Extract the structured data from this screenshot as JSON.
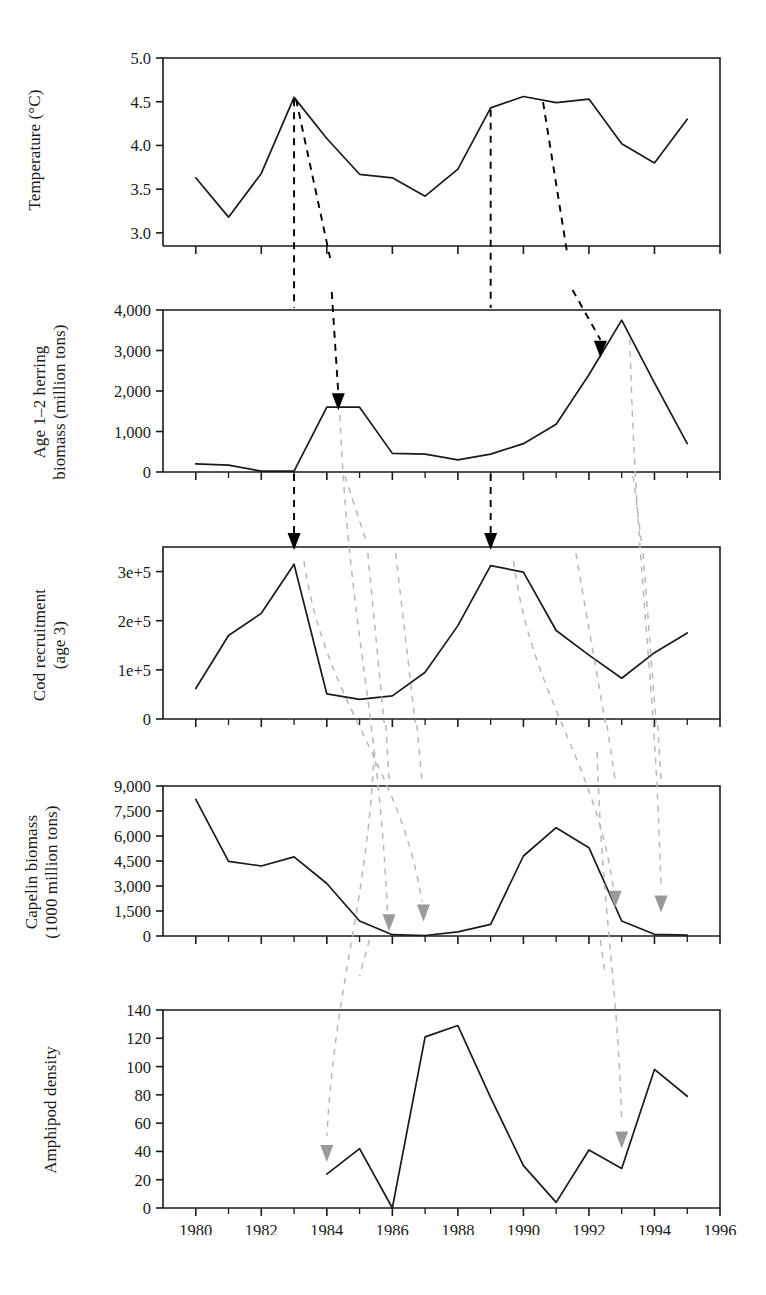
{
  "figure": {
    "width": 766,
    "height": 1295,
    "background": "#ffffff",
    "line_color": "#1a1a1a",
    "axis_color": "#1a1a1a",
    "black_arrow_color": "#000000",
    "gray_arrow_color": "#9a9a9a",
    "dashed_black_color": "#000000",
    "dashed_gray_color": "#b8b8b8"
  },
  "x_axis": {
    "label": "",
    "min": 1979,
    "max": 1996,
    "ticks": [
      1980,
      1982,
      1984,
      1986,
      1988,
      1990,
      1992,
      1994,
      1996
    ],
    "tick_labels": [
      "1980",
      "1982",
      "1984",
      "1986",
      "1988",
      "1990",
      "1992",
      "1994",
      "1996"
    ],
    "minor_step": 1
  },
  "chart_data": [
    {
      "type": "line",
      "panel": 1,
      "title": "",
      "ylabel": "Temperature (°C)",
      "xlabel": "",
      "ylim": [
        2.85,
        5.0
      ],
      "yticks": [
        3.0,
        3.5,
        4.0,
        4.5,
        5.0
      ],
      "ytick_labels": [
        "3.0",
        "3.5",
        "4.0",
        "4.5",
        "5.0"
      ],
      "x": [
        1980,
        1981,
        1982,
        1983,
        1984,
        1985,
        1986,
        1987,
        1988,
        1989,
        1990,
        1991,
        1992,
        1993,
        1994,
        1995
      ],
      "values": [
        3.63,
        3.18,
        3.68,
        4.55,
        4.08,
        3.67,
        3.63,
        3.42,
        3.73,
        4.43,
        4.56,
        4.49,
        4.53,
        4.02,
        3.8,
        4.3
      ],
      "grid": false,
      "legend": "none"
    },
    {
      "type": "line",
      "panel": 2,
      "title": "",
      "ylabel": "Age 1–2 herring biomass (million tons)",
      "ylabel_lines": [
        "Age 1–2 herring",
        "biomass (million tons)"
      ],
      "xlabel": "",
      "ylim": [
        0,
        4000
      ],
      "yticks": [
        0,
        1000,
        2000,
        3000,
        4000
      ],
      "ytick_labels": [
        "0",
        "1,000",
        "2,000",
        "3,000",
        "4,000"
      ],
      "x": [
        1980,
        1981,
        1982,
        1983,
        1984,
        1985,
        1986,
        1987,
        1988,
        1989,
        1990,
        1991,
        1992,
        1993,
        1994,
        1995
      ],
      "values": [
        200,
        170,
        20,
        20,
        1600,
        1600,
        460,
        440,
        300,
        440,
        700,
        1180,
        2400,
        3750,
        2200,
        700
      ],
      "grid": false,
      "legend": "none"
    },
    {
      "type": "line",
      "panel": 3,
      "title": "",
      "ylabel": "Cod recruitment (age 3)",
      "ylabel_lines": [
        "Cod recruitment",
        "(age 3)"
      ],
      "xlabel": "",
      "ylim": [
        0,
        350000
      ],
      "yticks": [
        0,
        100000,
        200000,
        300000
      ],
      "ytick_labels": [
        "0",
        "1e+5",
        "2e+5",
        "3e+5"
      ],
      "x": [
        1980,
        1981,
        1982,
        1983,
        1984,
        1985,
        1986,
        1987,
        1988,
        1989,
        1990,
        1991,
        1992,
        1993,
        1994,
        1995
      ],
      "values": [
        62000,
        170000,
        215000,
        315000,
        51000,
        40000,
        47000,
        95000,
        190000,
        312000,
        299000,
        180000,
        130000,
        83000,
        135000,
        175000
      ],
      "grid": false,
      "legend": "none"
    },
    {
      "type": "line",
      "panel": 4,
      "title": "",
      "ylabel": "Capelin biomass (1000 million tons)",
      "ylabel_lines": [
        "Capelin biomass",
        "(1000 million tons)"
      ],
      "xlabel": "",
      "ylim": [
        0,
        9000
      ],
      "yticks": [
        0,
        1500,
        3000,
        4500,
        6000,
        7500,
        9000
      ],
      "ytick_labels": [
        "0",
        "1,500",
        "3,000",
        "4,500",
        "6,000",
        "7,500",
        "9,000"
      ],
      "x": [
        1980,
        1981,
        1982,
        1983,
        1984,
        1985,
        1986,
        1987,
        1988,
        1989,
        1990,
        1991,
        1992,
        1993,
        1994,
        1995
      ],
      "values": [
        8200,
        4480,
        4200,
        4750,
        3150,
        900,
        80,
        30,
        250,
        700,
        4800,
        6500,
        5300,
        900,
        100,
        50
      ],
      "grid": false,
      "legend": "none"
    },
    {
      "type": "line",
      "panel": 5,
      "title": "",
      "ylabel": "Amphipod density",
      "xlabel": "",
      "ylim": [
        0,
        140
      ],
      "yticks": [
        0,
        20,
        40,
        60,
        80,
        100,
        120,
        140
      ],
      "ytick_labels": [
        "0",
        "20",
        "40",
        "60",
        "80",
        "100",
        "120",
        "140"
      ],
      "x": [
        1984,
        1985,
        1986,
        1987,
        1988,
        1989,
        1990,
        1991,
        1992,
        1993,
        1994,
        1995
      ],
      "values": [
        24,
        42,
        0,
        121,
        129,
        78,
        30,
        4,
        41,
        28,
        98,
        79
      ],
      "grid": false,
      "legend": "none"
    }
  ],
  "annotations": {
    "black_connectors": [
      {
        "name": "temp-1983-peak-to-herring-1983",
        "from_panel": 1,
        "from_x": 1983,
        "to_panel": 2,
        "to_x": 1983,
        "style": "dashed-black"
      },
      {
        "name": "temp-1983-peak-to-herring-1984",
        "from_panel": 1,
        "from_x": 1983,
        "to_panel": 2,
        "to_x": 1984.3,
        "style": "dashed-black",
        "arrowhead": "black"
      },
      {
        "name": "temp-1989-to-cod-1989",
        "from_panel": 1,
        "from_x": 1989,
        "to_panel": 3,
        "to_x": 1989,
        "style": "dashed-black"
      },
      {
        "name": "temp-1990-to-herring-1992",
        "from_panel": 1,
        "from_x": 1990.5,
        "to_panel": 2,
        "to_x": 1992.3,
        "style": "dashed-black",
        "arrowhead": "black"
      }
    ],
    "gray_connectors": [
      {
        "name": "herring-1984-to-capelin-1986",
        "from_panel": 2,
        "from_x": 1984.3,
        "to_panel": 4,
        "to_x": 1986.0,
        "style": "dashed-gray",
        "arrowhead": "gray"
      },
      {
        "name": "cod-1983-to-capelin-1987",
        "from_panel": 3,
        "from_x": 1983.2,
        "to_panel": 4,
        "to_x": 1987.0,
        "style": "dashed-gray",
        "arrowhead": "gray"
      },
      {
        "name": "cod-1989-to-capelin-1993",
        "from_panel": 3,
        "from_x": 1989.6,
        "to_panel": 4,
        "to_x": 1993.0,
        "style": "dashed-gray",
        "arrowhead": "gray"
      },
      {
        "name": "herring-1993-to-capelin-1994",
        "from_panel": 2,
        "from_x": 1993.2,
        "to_panel": 4,
        "to_x": 1994.2,
        "style": "dashed-gray",
        "arrowhead": "gray"
      },
      {
        "name": "capelin-1986-to-amphipod-1984",
        "from_panel": 4,
        "from_x": 1985.4,
        "to_panel": 5,
        "to_x": 1984.0,
        "style": "dashed-gray",
        "arrowhead": "gray"
      },
      {
        "name": "capelin-1993-to-amphipod-1993",
        "from_panel": 4,
        "from_x": 1992.2,
        "to_panel": 5,
        "to_x": 1993.0,
        "style": "dashed-gray",
        "arrowhead": "gray"
      }
    ]
  }
}
